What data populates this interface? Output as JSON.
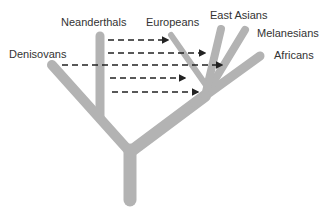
{
  "diagram": {
    "type": "phylogenetic-tree-with-introgression",
    "labels": {
      "neanderthals": "Neanderthals",
      "denisovans": "Denisovans",
      "europeans": "Europeans",
      "east_asians": "East Asians",
      "melanesians": "Melanesians",
      "africans": "Africans"
    },
    "colors": {
      "branch": "#b3b3b3",
      "arrow": "#222222",
      "text": "#333333",
      "background": "#ffffff"
    },
    "gene_flow_arrows": [
      {
        "from": "Neanderthals",
        "to": "Europeans"
      },
      {
        "from": "Neanderthals",
        "to": "East Asians"
      },
      {
        "from": "Denisovans",
        "to": "Melanesians"
      },
      {
        "from": "Neanderthals",
        "to": "Asian-European ancestor"
      },
      {
        "from": "Neanderthals",
        "to": "Out-of-Africa ancestor"
      }
    ]
  }
}
